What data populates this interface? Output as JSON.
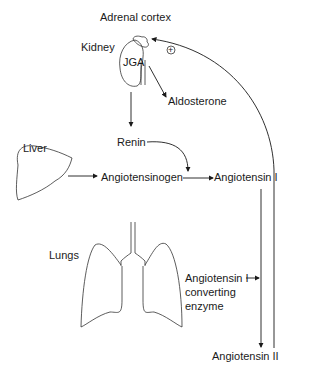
{
  "labels": {
    "adrenal_cortex": "Adrenal cortex",
    "kidney": "Kidney",
    "jga": "JGA",
    "plus": "+",
    "aldosterone": "Aldosterone",
    "renin": "Renin",
    "liver": "Liver",
    "angiotensinogen": "Angiotensinogen",
    "angiotensin_1": "Angiotensin I",
    "lungs": "Lungs",
    "ace_line1": "Angiotensin I",
    "ace_line2": "converting",
    "ace_line3": "enzyme",
    "angiotensin_2": "Angiotensin II"
  },
  "colors": {
    "line": "#1a1a1a",
    "background": "#ffffff"
  }
}
